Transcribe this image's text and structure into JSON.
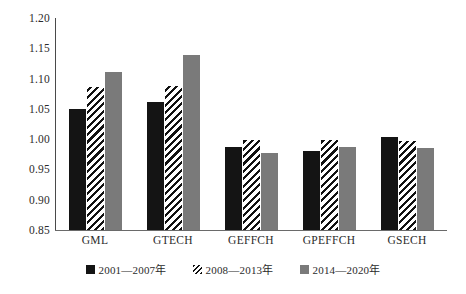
{
  "chart_data": {
    "type": "bar",
    "title": "",
    "xlabel": "",
    "ylabel": "",
    "ylim": [
      0.85,
      1.2
    ],
    "ytick_labels": [
      "1.20",
      "1.15",
      "1.10",
      "1.05",
      "1.00",
      "0.95",
      "0.90",
      "0.85"
    ],
    "ytick_values": [
      1.2,
      1.15,
      1.1,
      1.05,
      1.0,
      0.95,
      0.9,
      0.85
    ],
    "grid": false,
    "legend_position": "bottom",
    "categories": [
      "GML",
      "GTECH",
      "GEFFCH",
      "GPEFFCH",
      "GSECH"
    ],
    "series": [
      {
        "name": "2001—2007年",
        "color": "#141414",
        "fill": "solid-black",
        "values": [
          1.05,
          1.061,
          0.987,
          0.981,
          1.004
        ]
      },
      {
        "name": "2008—2013年",
        "color": "#ffffff",
        "fill": "diagonal-hatch",
        "values": [
          1.086,
          1.087,
          0.998,
          0.998,
          0.997
        ]
      },
      {
        "name": "2014—2020年",
        "color": "#7a7a7a",
        "fill": "solid-gray",
        "values": [
          1.111,
          1.139,
          0.977,
          0.987,
          0.986
        ]
      }
    ]
  }
}
